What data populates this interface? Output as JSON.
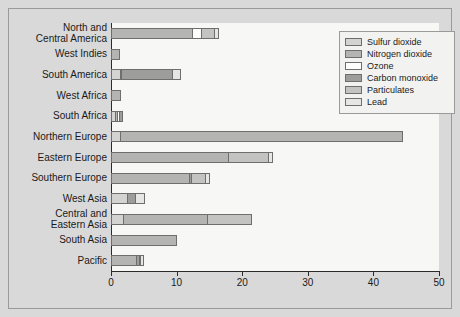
{
  "chart_data": {
    "type": "bar",
    "orientation": "horizontal",
    "stacked": true,
    "title": "",
    "xlabel": "",
    "ylabel": "",
    "xlim": [
      0,
      50
    ],
    "xticks": [
      0,
      10,
      20,
      30,
      40,
      50
    ],
    "xticklabels": [
      "0",
      "10",
      "20",
      "30",
      "40",
      "50"
    ],
    "grid": false,
    "legend_position": "upper right",
    "categories": [
      "North and\nCentral America",
      "West Indies",
      "South America",
      "West Africa",
      "South Africa",
      "Northern Europe",
      "Eastern Europe",
      "Southern Europe",
      "West Asia",
      "Central and\nEastern Asia",
      "South Asia",
      "Pacific"
    ],
    "series": [
      {
        "name": "Sulfur dioxide",
        "color": "#d3d3d1",
        "values": [
          0,
          0,
          1.5,
          0,
          0.8,
          1.6,
          0,
          0,
          2.6,
          2.0,
          0,
          0
        ]
      },
      {
        "name": "Nitrogen dioxide",
        "color": "#b4b4b2",
        "values": [
          12.5,
          1.4,
          0.2,
          1.5,
          0.4,
          43.0,
          18.0,
          12.0,
          0,
          13.0,
          10.0,
          4.0
        ]
      },
      {
        "name": "Ozone",
        "color": "#fdfdfc",
        "values": [
          1.6,
          0,
          0,
          0,
          0.5,
          0,
          0,
          0,
          0,
          0,
          0,
          0
        ]
      },
      {
        "name": "Carbon monoxide",
        "color": "#9d9d9b",
        "values": [
          0,
          0,
          8.0,
          0,
          0.6,
          0,
          0,
          0.5,
          1.4,
          0,
          0,
          0.5
        ]
      },
      {
        "name": "Particulates",
        "color": "#c3c3c1",
        "values": [
          2.0,
          0,
          0,
          0,
          0,
          0,
          6.3,
          2.3,
          0,
          6.8,
          0,
          0.3
        ]
      },
      {
        "name": "Lead",
        "color": "#e6e6e4",
        "values": [
          0.9,
          0,
          1.3,
          0,
          0,
          0,
          0.7,
          0.7,
          1.5,
          0,
          0,
          0.7
        ]
      }
    ],
    "totals": [
      17.0,
      1.4,
      11.0,
      1.5,
      2.3,
      44.6,
      25.0,
      15.5,
      5.5,
      21.8,
      10.0,
      5.5
    ]
  },
  "legend": {
    "items": [
      {
        "label": "Sulfur dioxide",
        "color": "#d3d3d1"
      },
      {
        "label": "Nitrogen dioxide",
        "color": "#b4b4b2"
      },
      {
        "label": "Ozone",
        "color": "#fdfdfc"
      },
      {
        "label": "Carbon monoxide",
        "color": "#9d9d9b"
      },
      {
        "label": "Particulates",
        "color": "#c3c3c1"
      },
      {
        "label": "Lead",
        "color": "#e6e6e4"
      }
    ]
  },
  "colors": {
    "figure_background": "#d9d9d9",
    "plot_background": "#f7f7f5",
    "axis": "#2b2b2b",
    "segment_border": "#6e6e6e",
    "frame_border": "#9a9a9a"
  }
}
